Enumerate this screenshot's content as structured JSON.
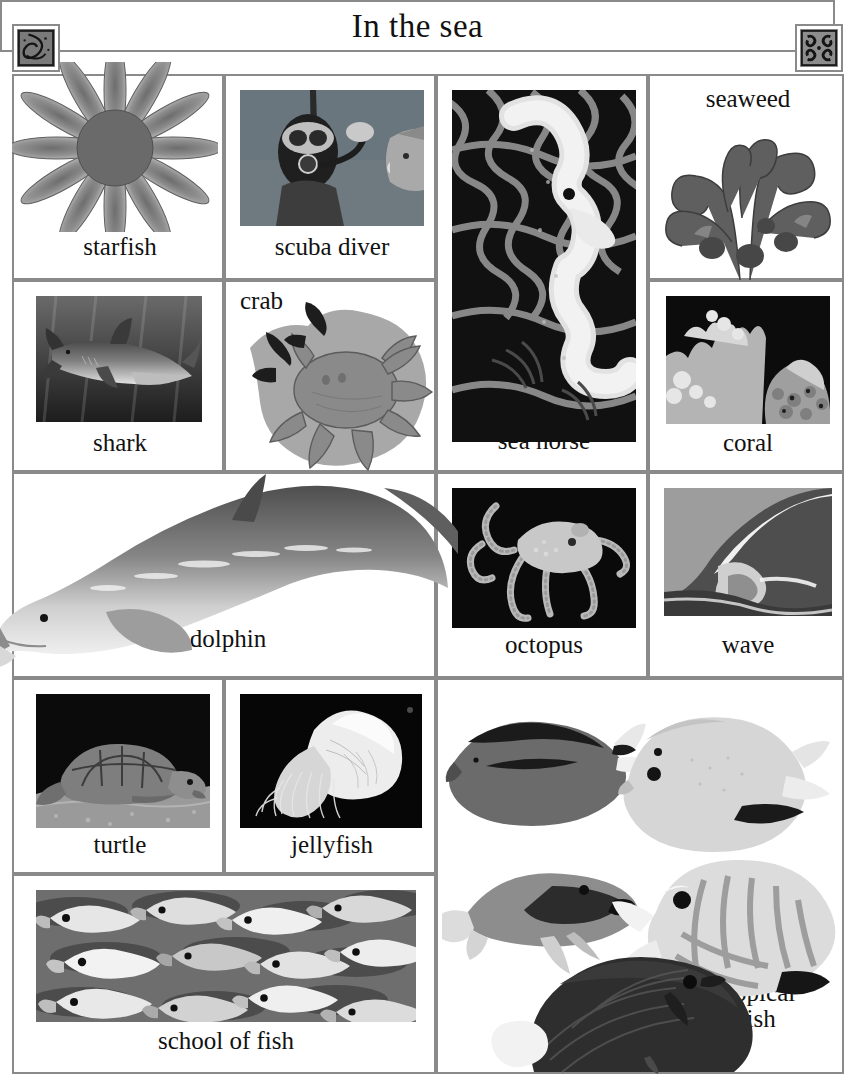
{
  "title": "In the sea",
  "ornaments": {
    "left": "shell-ornament-icon",
    "right": "coral-knot-ornament-icon"
  },
  "items": [
    {
      "id": "starfish",
      "label": "starfish",
      "image": "starfish-photo",
      "label_position": "below"
    },
    {
      "id": "scuba",
      "label": "scuba diver",
      "image": "scuba-diver-photo",
      "label_position": "below"
    },
    {
      "id": "seahorse",
      "label": "sea horse",
      "image": "sea-horse-photo",
      "label_position": "below"
    },
    {
      "id": "seaweed",
      "label": "seaweed",
      "image": "seaweed-photo",
      "label_position": "above"
    },
    {
      "id": "shark",
      "label": "shark",
      "image": "shark-photo",
      "label_position": "below"
    },
    {
      "id": "crab",
      "label": "crab",
      "image": "crab-photo",
      "label_position": "above"
    },
    {
      "id": "coral",
      "label": "coral",
      "image": "coral-photo",
      "label_position": "below"
    },
    {
      "id": "dolphin",
      "label": "dolphin",
      "image": "dolphin-photo",
      "label_position": "below"
    },
    {
      "id": "octopus",
      "label": "octopus",
      "image": "octopus-photo",
      "label_position": "below"
    },
    {
      "id": "wave",
      "label": "wave",
      "image": "wave-photo",
      "label_position": "below"
    },
    {
      "id": "turtle",
      "label": "turtle",
      "image": "turtle-photo",
      "label_position": "below"
    },
    {
      "id": "jellyfish",
      "label": "jellyfish",
      "image": "jellyfish-photo",
      "label_position": "below"
    },
    {
      "id": "school",
      "label": "school of fish",
      "image": "school-of-fish-photo",
      "label_position": "below"
    },
    {
      "id": "tropical",
      "label": "tropical\nfish",
      "image": "tropical-fish-photo",
      "label_position": "right"
    }
  ],
  "colors": {
    "border": "#8a8a8a",
    "text": "#111111",
    "background": "#ffffff"
  }
}
